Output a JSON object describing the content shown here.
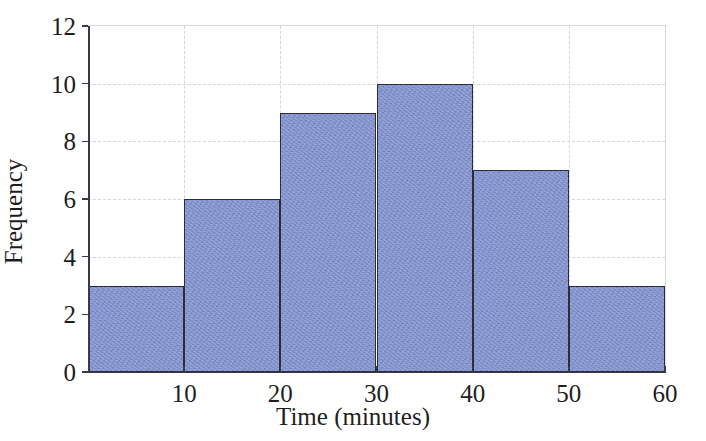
{
  "chart_data": {
    "type": "bar",
    "title": "",
    "subtitle": "",
    "xlabel": "Time (minutes)",
    "ylabel": "Frequency",
    "bin_edges": [
      0,
      10,
      20,
      30,
      40,
      50,
      60
    ],
    "categories": [
      "0-10",
      "10-20",
      "20-30",
      "30-40",
      "40-50",
      "50-60"
    ],
    "values": [
      3,
      6,
      9,
      10,
      7,
      3
    ],
    "xlim": [
      0,
      60
    ],
    "ylim": [
      0,
      12
    ],
    "xticks": [
      10,
      20,
      30,
      40,
      50,
      60
    ],
    "xtick_labels": [
      "10",
      "20",
      "30",
      "40",
      "50",
      "60"
    ],
    "yticks": [
      0,
      2,
      4,
      6,
      8,
      10,
      12
    ],
    "ytick_labels": [
      "0",
      "2",
      "4",
      "6",
      "8",
      "10",
      "12"
    ],
    "grid": true,
    "grid_style": "dashed",
    "legend": null,
    "legend_position": "none",
    "annotations": [],
    "colors": {
      "bar_fill": "#7f8fcc",
      "bar_edge": "#2b2d3c",
      "grid": "#d6d6da",
      "axis": "#3a3a42",
      "background": "#ffffff",
      "text": "#1e1e22"
    }
  }
}
